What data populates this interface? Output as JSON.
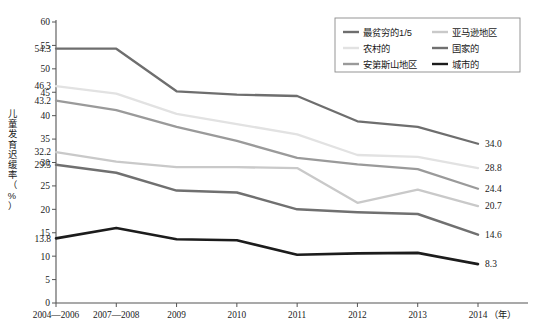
{
  "chart_data": {
    "type": "line",
    "title": "",
    "xlabel": "年",
    "ylabel": "儿童发育迟缓率（%）",
    "ylim": [
      0,
      60
    ],
    "ytick_step": 5,
    "grid": false,
    "legend_position": "top-right",
    "categories": [
      "2004—2006",
      "2007—2008",
      "2009",
      "2010",
      "2011",
      "2012",
      "2013",
      "2014"
    ],
    "yticks": [
      "0",
      "5",
      "10",
      "15",
      "20",
      "25",
      "30",
      "35",
      "40",
      "45",
      "50",
      "55",
      "60"
    ],
    "series": [
      {
        "name": "最贫穷的1/5",
        "color": "#6e6e6e",
        "width": 2.3,
        "values": [
          54.3,
          54.3,
          45.2,
          44.5,
          44.2,
          38.8,
          37.6,
          34.0
        ],
        "start_label": "54.3",
        "end_label": "34.0"
      },
      {
        "name": "农村的",
        "color": "#e2e2e2",
        "width": 2.3,
        "values": [
          46.3,
          44.7,
          40.4,
          38.2,
          36.0,
          31.6,
          31.2,
          28.8
        ],
        "start_label": "46.3",
        "end_label": "28.8"
      },
      {
        "name": "安第斯山地区",
        "color": "#9a9a9a",
        "width": 2.3,
        "values": [
          43.2,
          41.2,
          37.6,
          34.6,
          31.0,
          29.6,
          28.6,
          24.4
        ],
        "start_label": "43.2",
        "end_label": "24.4"
      },
      {
        "name": "亚马逊地区",
        "color": "#c9c9c9",
        "width": 2.3,
        "values": [
          32.2,
          30.2,
          29.0,
          29.0,
          28.8,
          21.4,
          24.2,
          20.7
        ],
        "start_label": "32.2",
        "end_label": "20.7"
      },
      {
        "name": "国家的",
        "color": "#707070",
        "width": 2.5,
        "values": [
          29.5,
          27.8,
          24.0,
          23.6,
          20.0,
          19.4,
          19.0,
          14.6
        ],
        "start_label": "29.5",
        "end_label": "14.6"
      },
      {
        "name": "城市的",
        "color": "#1c1c1c",
        "width": 2.6,
        "values": [
          13.8,
          16.0,
          13.6,
          13.4,
          10.3,
          10.6,
          10.7,
          8.3
        ],
        "start_label": "13.8",
        "end_label": "8.3"
      }
    ],
    "legend_entries": [
      {
        "label": "最贫穷的1/5",
        "color": "#6e6e6e"
      },
      {
        "label": "亚马逊地区",
        "color": "#c9c9c9"
      },
      {
        "label": "农村的",
        "color": "#e2e2e2"
      },
      {
        "label": "国家的",
        "color": "#707070"
      },
      {
        "label": "安第斯山地区",
        "color": "#9a9a9a"
      },
      {
        "label": "城市的",
        "color": "#1c1c1c"
      }
    ]
  }
}
